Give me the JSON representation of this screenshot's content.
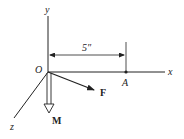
{
  "diagram": {
    "origin_label": "O",
    "axes": {
      "x": "x",
      "y": "y",
      "z": "z"
    },
    "point_label": "A",
    "dimension_label": "5″",
    "force_label": "F",
    "moment_label": "M",
    "colors": {
      "stroke": "#222222",
      "background": "#ffffff"
    }
  }
}
